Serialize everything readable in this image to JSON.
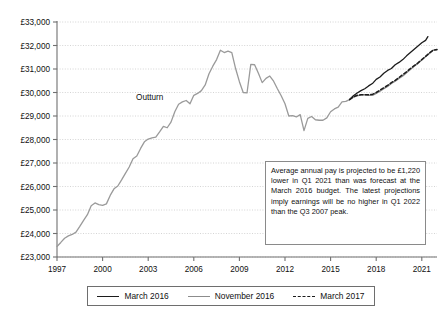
{
  "chart_data": {
    "type": "line",
    "title": "",
    "xlabel": "",
    "ylabel": "",
    "currency_symbol": "£",
    "xlim": [
      1997,
      2022
    ],
    "ylim": [
      23000,
      33000
    ],
    "grid": true,
    "y_ticks": [
      23000,
      24000,
      25000,
      26000,
      27000,
      28000,
      29000,
      30000,
      31000,
      32000,
      33000
    ],
    "y_tick_labels": [
      "£23,000",
      "£24,000",
      "£25,000",
      "£26,000",
      "£27,000",
      "£28,000",
      "£29,000",
      "£30,000",
      "£31,000",
      "£32,000",
      "£33,000"
    ],
    "x_ticks": [
      1997,
      2000,
      2003,
      2006,
      2009,
      2012,
      2015,
      2018,
      2021
    ],
    "x_tick_labels": [
      "1997",
      "2000",
      "2003",
      "2006",
      "2009",
      "2012",
      "2015",
      "2018",
      "2021"
    ],
    "legend_position": "bottom",
    "annotations": [
      {
        "name": "outturn-label",
        "text": "Outturn",
        "x": 2003.1,
        "y": 29700
      }
    ],
    "series": [
      {
        "name": "Outturn",
        "style": "solid",
        "color": "#9a9a9a",
        "in_legend": false,
        "points": [
          [
            1997.0,
            23450
          ],
          [
            1997.25,
            23620
          ],
          [
            1997.5,
            23800
          ],
          [
            1997.75,
            23900
          ],
          [
            1998.0,
            23960
          ],
          [
            1998.25,
            24060
          ],
          [
            1998.5,
            24300
          ],
          [
            1998.75,
            24560
          ],
          [
            1999.0,
            24800
          ],
          [
            1999.25,
            25180
          ],
          [
            1999.5,
            25300
          ],
          [
            1999.75,
            25230
          ],
          [
            2000.0,
            25200
          ],
          [
            2000.25,
            25260
          ],
          [
            2000.5,
            25620
          ],
          [
            2000.75,
            25900
          ],
          [
            2001.0,
            26020
          ],
          [
            2001.25,
            26280
          ],
          [
            2001.5,
            26560
          ],
          [
            2001.75,
            26830
          ],
          [
            2002.0,
            27180
          ],
          [
            2002.25,
            27300
          ],
          [
            2002.5,
            27620
          ],
          [
            2002.75,
            27900
          ],
          [
            2003.0,
            28020
          ],
          [
            2003.25,
            28070
          ],
          [
            2003.5,
            28100
          ],
          [
            2003.75,
            28320
          ],
          [
            2004.0,
            28560
          ],
          [
            2004.25,
            28500
          ],
          [
            2004.5,
            28740
          ],
          [
            2004.75,
            29180
          ],
          [
            2005.0,
            29500
          ],
          [
            2005.25,
            29600
          ],
          [
            2005.5,
            29660
          ],
          [
            2005.75,
            29520
          ],
          [
            2006.0,
            29880
          ],
          [
            2006.25,
            29960
          ],
          [
            2006.5,
            30080
          ],
          [
            2006.75,
            30320
          ],
          [
            2007.0,
            30800
          ],
          [
            2007.25,
            31120
          ],
          [
            2007.5,
            31400
          ],
          [
            2007.75,
            31800
          ],
          [
            2008.0,
            31700
          ],
          [
            2008.25,
            31760
          ],
          [
            2008.5,
            31700
          ],
          [
            2008.75,
            31020
          ],
          [
            2009.0,
            30460
          ],
          [
            2009.25,
            30000
          ],
          [
            2009.5,
            29980
          ],
          [
            2009.75,
            31200
          ],
          [
            2010.0,
            31180
          ],
          [
            2010.25,
            30820
          ],
          [
            2010.5,
            30420
          ],
          [
            2010.75,
            30600
          ],
          [
            2011.0,
            30700
          ],
          [
            2011.25,
            30480
          ],
          [
            2011.5,
            30160
          ],
          [
            2011.75,
            29860
          ],
          [
            2012.0,
            29520
          ],
          [
            2012.25,
            29000
          ],
          [
            2012.5,
            29020
          ],
          [
            2012.75,
            28960
          ],
          [
            2013.0,
            29060
          ],
          [
            2013.25,
            28380
          ],
          [
            2013.5,
            28900
          ],
          [
            2013.75,
            28980
          ],
          [
            2014.0,
            28840
          ],
          [
            2014.25,
            28820
          ],
          [
            2014.5,
            28820
          ],
          [
            2014.75,
            28920
          ],
          [
            2015.0,
            29180
          ],
          [
            2015.25,
            29300
          ],
          [
            2015.5,
            29380
          ],
          [
            2015.75,
            29600
          ],
          [
            2016.0,
            29620
          ],
          [
            2016.25,
            29700
          ]
        ]
      },
      {
        "name": "March 2016",
        "style": "solid",
        "color": "#1c1c1c",
        "in_legend": true,
        "points": [
          [
            2016.25,
            29700
          ],
          [
            2016.5,
            29860
          ],
          [
            2016.75,
            29980
          ],
          [
            2017.0,
            30080
          ],
          [
            2017.25,
            30160
          ],
          [
            2017.5,
            30280
          ],
          [
            2017.75,
            30380
          ],
          [
            2018.0,
            30560
          ],
          [
            2018.25,
            30660
          ],
          [
            2018.5,
            30820
          ],
          [
            2018.75,
            30940
          ],
          [
            2019.0,
            31020
          ],
          [
            2019.25,
            31180
          ],
          [
            2019.5,
            31280
          ],
          [
            2019.75,
            31400
          ],
          [
            2020.0,
            31560
          ],
          [
            2020.25,
            31700
          ],
          [
            2020.5,
            31840
          ],
          [
            2020.75,
            31980
          ],
          [
            2021.0,
            32120
          ],
          [
            2021.25,
            32220
          ],
          [
            2021.4,
            32380
          ]
        ]
      },
      {
        "name": "November 2016",
        "style": "solid",
        "color": "#8c8c8c",
        "in_legend": true,
        "points": [
          [
            2016.25,
            29700
          ],
          [
            2016.5,
            29800
          ],
          [
            2016.75,
            29860
          ],
          [
            2017.0,
            29900
          ],
          [
            2017.25,
            29900
          ],
          [
            2017.5,
            29880
          ],
          [
            2017.75,
            29880
          ],
          [
            2018.0,
            29960
          ],
          [
            2018.25,
            30060
          ],
          [
            2018.5,
            30160
          ],
          [
            2018.75,
            30260
          ],
          [
            2019.0,
            30380
          ],
          [
            2019.25,
            30480
          ],
          [
            2019.5,
            30600
          ],
          [
            2019.75,
            30700
          ],
          [
            2020.0,
            30840
          ],
          [
            2020.25,
            30980
          ],
          [
            2020.5,
            31120
          ],
          [
            2020.75,
            31240
          ],
          [
            2021.0,
            31380
          ],
          [
            2021.25,
            31520
          ],
          [
            2021.5,
            31660
          ],
          [
            2021.75,
            31800
          ],
          [
            2022.0,
            31820
          ]
        ]
      },
      {
        "name": "March 2017",
        "style": "dashed",
        "color": "#1c1c1c",
        "in_legend": true,
        "points": [
          [
            2016.25,
            29700
          ],
          [
            2016.5,
            29820
          ],
          [
            2016.75,
            29880
          ],
          [
            2017.0,
            29900
          ],
          [
            2017.25,
            29900
          ],
          [
            2017.5,
            29900
          ],
          [
            2017.75,
            29920
          ],
          [
            2018.0,
            30000
          ],
          [
            2018.25,
            30100
          ],
          [
            2018.5,
            30200
          ],
          [
            2018.75,
            30300
          ],
          [
            2019.0,
            30420
          ],
          [
            2019.25,
            30520
          ],
          [
            2019.5,
            30640
          ],
          [
            2019.75,
            30760
          ],
          [
            2020.0,
            30880
          ],
          [
            2020.25,
            31020
          ],
          [
            2020.5,
            31140
          ],
          [
            2020.75,
            31260
          ],
          [
            2021.0,
            31400
          ],
          [
            2021.25,
            31540
          ],
          [
            2021.5,
            31680
          ],
          [
            2021.75,
            31800
          ],
          [
            2022.0,
            31830
          ]
        ]
      }
    ]
  },
  "note": {
    "text": "Average annual pay is projected to be £1,220 lower in Q1 2021 than was forecast at the March 2016 budget. The latest projections imply earnings will be no higher in Q1 2022 than the Q3 2007 peak."
  },
  "legend": {
    "items": [
      {
        "label": "March 2016",
        "style": "solid-dark"
      },
      {
        "label": "November 2016",
        "style": "solid-grey"
      },
      {
        "label": "March 2017",
        "style": "dashed"
      }
    ]
  },
  "colors": {
    "outturn": "#9a9a9a",
    "march_2016": "#1c1c1c",
    "november_2016": "#8c8c8c",
    "march_2017": "#1c1c1c",
    "grid": "#c9c9c9",
    "axis": "#707070"
  }
}
